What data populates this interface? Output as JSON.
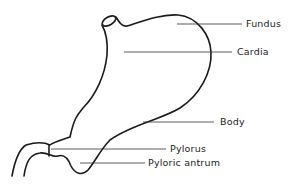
{
  "diagram": {
    "labels": [
      {
        "id": "fundus",
        "text": "Fundus"
      },
      {
        "id": "cardia",
        "text": "Cardia"
      },
      {
        "id": "body",
        "text": "Body"
      },
      {
        "id": "pylorus",
        "text": "Pylorus"
      },
      {
        "id": "pyloric-antrum",
        "text": "Pyloric antrum"
      }
    ],
    "colors": {
      "outline": "#1a1a1a",
      "leader": "#333333",
      "background": "#ffffff"
    }
  }
}
